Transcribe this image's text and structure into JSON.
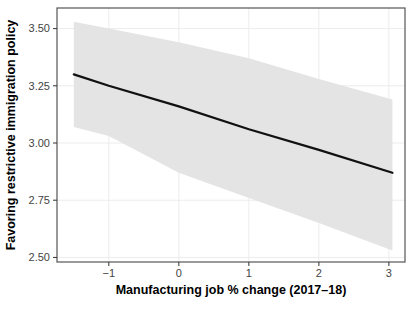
{
  "figure": {
    "background": "#ffffff"
  },
  "chart_data": {
    "type": "line",
    "subtype": "linear-regression-with-confidence-band",
    "title": "",
    "xlabel": "Manufacturing job % change (2017–18)",
    "ylabel": "Favoring restrictive immigration policy",
    "x": [
      -1.5,
      -1.0,
      0.0,
      1.0,
      2.0,
      3.05
    ],
    "series": [
      {
        "name": "linear-fit",
        "values": [
          3.3,
          3.25,
          3.16,
          3.06,
          2.97,
          2.87
        ]
      },
      {
        "name": "ci-upper",
        "values": [
          3.53,
          3.5,
          3.44,
          3.37,
          3.28,
          3.19
        ]
      },
      {
        "name": "ci-lower",
        "values": [
          3.07,
          3.03,
          2.87,
          2.76,
          2.65,
          2.53
        ]
      }
    ],
    "x_ticks": {
      "values": [
        -1,
        0,
        1,
        2,
        3
      ],
      "labels": [
        "−1",
        "0",
        "1",
        "2",
        "3"
      ]
    },
    "y_ticks": {
      "values": [
        2.5,
        2.75,
        3.0,
        3.25,
        3.5
      ],
      "labels": [
        "2.50",
        "2.75",
        "3.00",
        "3.25",
        "3.50"
      ]
    },
    "xlim": [
      -1.74,
      3.23
    ],
    "ylim": [
      2.48,
      3.59
    ],
    "grid": "major",
    "legend": "none",
    "colors": {
      "line": "#111111",
      "ci_band": "#e4e4e4",
      "grid": "#ececec",
      "panel_border": "#555555",
      "tick_mark": "#333333",
      "tick_text": "#444444",
      "axis_title": "#000000",
      "background": "#ffffff"
    }
  }
}
